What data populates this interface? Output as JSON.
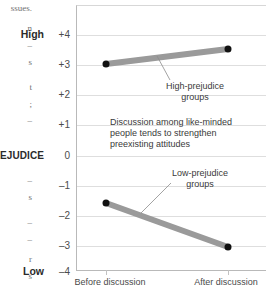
{
  "gutter_fragments": [
    {
      "text": "ssues.",
      "top": 4
    },
    {
      "text": "n",
      "top": 24
    },
    {
      "text": "–",
      "top": 41
    },
    {
      "text": "s",
      "top": 58
    },
    {
      "text": "t",
      "top": 83
    },
    {
      "text": ";",
      "top": 100
    },
    {
      "text": "–",
      "top": 116
    },
    {
      "text": "–",
      "top": 176
    },
    {
      "text": "s",
      "top": 193
    },
    {
      "text": "–",
      "top": 218
    },
    {
      "text": "–",
      "top": 235
    },
    {
      "text": "r",
      "top": 255
    },
    {
      "text": "s",
      "top": 272
    }
  ],
  "chart_data": {
    "type": "line",
    "title": "",
    "xlabel": "",
    "ylabel": "PREJUDICE",
    "ylim": [
      -4,
      4
    ],
    "grid": true,
    "legend_position": "inline-annotation",
    "x": [
      "Before discussion",
      "After discussion"
    ],
    "categories": [
      "Before discussion",
      "After discussion"
    ],
    "ytick_labels": [
      "+4",
      "+3",
      "+2",
      "+1",
      "0",
      "–1",
      "–2",
      "–3",
      "–4"
    ],
    "ytick_values": [
      4,
      3,
      2,
      1,
      0,
      -1,
      -2,
      -3,
      -4
    ],
    "axis_extreme_high": "High",
    "axis_extreme_low": "Low",
    "series": [
      {
        "name": "High-prejudice groups",
        "values": [
          2.95,
          3.45
        ],
        "color": "#9a9a9a"
      },
      {
        "name": "Low-prejudice groups",
        "values": [
          -1.55,
          -3.0
        ],
        "color": "#9a9a9a"
      }
    ],
    "annotations": [
      {
        "name": "high-prejudice-label",
        "text": "High-prejudice\ngroups"
      },
      {
        "name": "low-prejudice-label",
        "text": "Low-prejudice\ngroups"
      },
      {
        "name": "caption-note",
        "text": "Discussion among like-minded\npeople tends to strengthen\npreexisting attitudes"
      }
    ],
    "colors": {
      "line": "#9a9a9a",
      "marker": "#111111",
      "grid": "#dedede",
      "axis": "#b9b9b9"
    }
  }
}
